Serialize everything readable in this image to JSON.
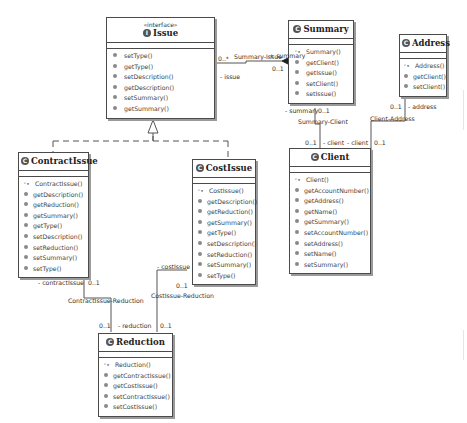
{
  "diagram": {
    "type": "UML class diagram",
    "classes": {
      "issue": {
        "stereotype": "«interface»",
        "name": "Issue",
        "badge": "I",
        "operations": [
          "setType()",
          "getType()",
          "setDescription()",
          "getDescription()",
          "setSummary()",
          "getSummary()"
        ]
      },
      "summary": {
        "name": "Summary",
        "badge": "C",
        "constructor": "Summary()",
        "operations": [
          "getClient()",
          "getIssue()",
          "setClient()",
          "setIssue()"
        ]
      },
      "address": {
        "name": "Address",
        "badge": "C",
        "constructor": "Address()",
        "operations": [
          "getClient()",
          "setClient()"
        ]
      },
      "client": {
        "name": "Client",
        "badge": "C",
        "constructor": "Client()",
        "operations": [
          "getAccountNumber()",
          "getAddress()",
          "getName()",
          "getSummary()",
          "setAccountNumber()",
          "setAddress()",
          "setName()",
          "setSummary()"
        ]
      },
      "contractissue": {
        "name": "ContractIssue",
        "badge": "C",
        "constructor": "ContractIssue()",
        "operations": [
          "getDescription()",
          "getReduction()",
          "getSummary()",
          "getType()",
          "setDescription()",
          "setReduction()",
          "setSummary()",
          "setType()"
        ]
      },
      "costissue": {
        "name": "CostIssue",
        "badge": "C",
        "constructor": "CostIssue()",
        "operations": [
          "getDescription()",
          "getReduction()",
          "getSummary()",
          "getType()",
          "setDescription()",
          "setReduction()",
          "setSummary()",
          "setType()"
        ]
      },
      "reduction": {
        "name": "Reduction",
        "badge": "C",
        "constructor": "Reduction()",
        "operations": [
          "getContractIssue()",
          "getCostIssue()",
          "setContractIssue()",
          "setCostIssue()"
        ]
      }
    },
    "associations": {
      "summary_issue": {
        "name": "Summary-Issue",
        "issue_mult": "0..*",
        "issue_role": "- issue",
        "summary_role": "+ summary",
        "summary_mult": "0..1"
      },
      "summary_client": {
        "name": "Summary-Client",
        "summary_role": "- summary",
        "summary_mult": "0..1",
        "client_mult": "0..1",
        "client_role": "- client"
      },
      "client_address": {
        "name": "Client-Address",
        "address_mult": "0..1",
        "address_role": "- address",
        "client_role": "- client",
        "client_mult": "0..1"
      },
      "contractissue_reduction": {
        "name": "ContractIssue-Reduction",
        "contract_role": "- contractIssue",
        "contract_mult": "0..1",
        "reduction_mult": "0..1",
        "reduction_role": "- reduction"
      },
      "costissue_reduction": {
        "name": "CostIssue-Reduction",
        "cost_role": "- costIssue",
        "cost_mult": "0..1",
        "reduction_mult": "0..1"
      }
    },
    "colors": {
      "border": "#4a4a4a",
      "shadow": "#9a9a9a",
      "badge": "#555555",
      "text": "#333333"
    }
  }
}
